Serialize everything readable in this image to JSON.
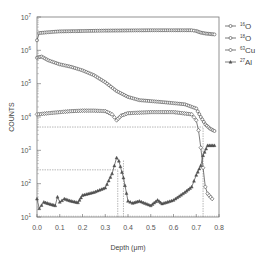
{
  "chart_data": {
    "type": "line",
    "title": "",
    "xlabel": "Depth (μm)",
    "ylabel": "COUNTS",
    "xlim": [
      0.0,
      0.8
    ],
    "ylim": [
      10,
      10000000
    ],
    "yscale": "log",
    "x_ticks": [
      "0.0",
      "0.1",
      "0.2",
      "0.3",
      "0.4",
      "0.5",
      "0.6",
      "0.7",
      "0.8"
    ],
    "y_ticks": [
      "10^1",
      "10^2",
      "10^3",
      "10^4",
      "10^5",
      "10^6",
      "10^7"
    ],
    "grid": false,
    "legend_position": "right-top",
    "series": [
      {
        "name": "16O",
        "mass": "16",
        "element": "O",
        "marker": "circle",
        "x": [
          0.0,
          0.01,
          0.05,
          0.1,
          0.2,
          0.3,
          0.4,
          0.5,
          0.6,
          0.68,
          0.7,
          0.72,
          0.74,
          0.76,
          0.78
        ],
        "y": [
          2000000,
          3300000,
          3500000,
          3700000,
          3800000,
          3900000,
          3950000,
          4000000,
          4000000,
          4000000,
          3800000,
          3400000,
          3200000,
          3100000,
          3000000
        ]
      },
      {
        "name": "18O",
        "mass": "18",
        "element": "O",
        "marker": "circle",
        "x": [
          0.0,
          0.02,
          0.05,
          0.1,
          0.15,
          0.2,
          0.25,
          0.3,
          0.35,
          0.4,
          0.45,
          0.5,
          0.55,
          0.6,
          0.65,
          0.7,
          0.72,
          0.74,
          0.76,
          0.78
        ],
        "y": [
          600000,
          650000,
          500000,
          380000,
          320000,
          250000,
          180000,
          110000,
          60000,
          40000,
          32000,
          30000,
          28000,
          26000,
          24000,
          18000,
          10000,
          6000,
          4500,
          3800
        ]
      },
      {
        "name": "63Cu",
        "mass": "63",
        "element": "Cu",
        "marker": "diamond",
        "x": [
          0.0,
          0.05,
          0.1,
          0.15,
          0.2,
          0.25,
          0.3,
          0.33,
          0.35,
          0.37,
          0.4,
          0.5,
          0.6,
          0.68,
          0.7,
          0.71,
          0.72,
          0.73,
          0.74,
          0.75,
          0.77
        ],
        "y": [
          12000,
          13000,
          14000,
          15000,
          15500,
          15500,
          15000,
          12000,
          8000,
          11000,
          13000,
          14000,
          14000,
          12000,
          8000,
          4000,
          1200,
          300,
          80,
          50,
          35
        ]
      },
      {
        "name": "27Al",
        "mass": "27",
        "element": "Al",
        "marker": "triangle",
        "x": [
          0.0,
          0.01,
          0.03,
          0.06,
          0.08,
          0.09,
          0.1,
          0.12,
          0.15,
          0.18,
          0.2,
          0.25,
          0.3,
          0.33,
          0.35,
          0.36,
          0.38,
          0.4,
          0.42,
          0.45,
          0.5,
          0.53,
          0.55,
          0.6,
          0.65,
          0.68,
          0.7,
          0.72,
          0.73,
          0.75,
          0.78
        ],
        "y": [
          35,
          18,
          28,
          24,
          22,
          40,
          28,
          35,
          30,
          27,
          45,
          55,
          75,
          200,
          600,
          480,
          150,
          30,
          26,
          30,
          22,
          32,
          25,
          32,
          55,
          80,
          180,
          350,
          700,
          1400,
          1400
        ]
      }
    ],
    "reference_lines": {
      "horizontal": [
        {
          "y": 5000,
          "x_from": 0.0,
          "x_to": 0.73
        },
        {
          "y": 260,
          "x_from": 0.0,
          "x_to": 0.355
        }
      ],
      "vertical": [
        {
          "x": 0.355,
          "y_from": 10,
          "y_to": 260
        },
        {
          "x": 0.38,
          "y_from": 10,
          "y_to": 500
        },
        {
          "x": 0.73,
          "y_from": 10,
          "y_to": 5000
        }
      ]
    }
  },
  "legend": [
    {
      "mass": "16",
      "element": "O"
    },
    {
      "mass": "18",
      "element": "O"
    },
    {
      "mass": "63",
      "element": "Cu"
    },
    {
      "mass": "27",
      "element": "Al"
    }
  ],
  "axes": {
    "xlabel": "Depth (μm)",
    "ylabel": "COUNTS"
  }
}
